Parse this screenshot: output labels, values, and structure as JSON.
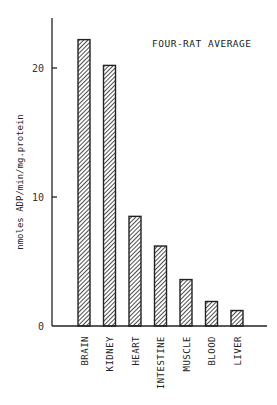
{
  "chart_data": {
    "type": "bar",
    "title": "FOUR-RAT AVERAGE",
    "xlabel": "",
    "ylabel": "nmoles ADP/min/mg.protein",
    "categories": [
      "BRAIN",
      "KIDNEY",
      "HEART",
      "INTESTINE",
      "MUSCLE",
      "BLOOD",
      "LIVER"
    ],
    "values": [
      22.2,
      20.2,
      8.5,
      6.2,
      3.6,
      1.9,
      1.2
    ],
    "ylim": [
      0,
      23.5
    ],
    "yticks": [
      0,
      10,
      20
    ],
    "ytick_labels": [
      "0",
      "10",
      "20"
    ],
    "grid": false,
    "legend": "none",
    "bar_style": "diagonal-hatch",
    "colors": {
      "bar_stroke": "#222222",
      "hatch": "#222222",
      "axis": "#222222"
    }
  }
}
